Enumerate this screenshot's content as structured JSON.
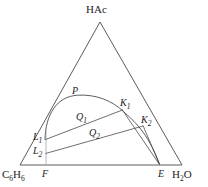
{
  "figure": {
    "type": "ternary-phase-diagram",
    "width": 208,
    "height": 187,
    "background_color": "#ffffff",
    "line_color": "#4a4a4a",
    "text_color": "#1c1c1c"
  },
  "vertices": {
    "apex": {
      "label": "HAc",
      "x": 100,
      "y": 22
    },
    "bottom_left": {
      "label_main": "C",
      "label_sub1": "6",
      "label_mid": "H",
      "label_sub2": "6",
      "label_full": "C6H6",
      "x": 20,
      "y": 165
    },
    "bottom_right": {
      "label_main": "H",
      "label_sub": "2",
      "label_tail": "O",
      "label_full": "H2O",
      "x": 182,
      "y": 165
    }
  },
  "points": [
    {
      "name": "P",
      "label": "P",
      "sub": "",
      "x": 78,
      "y": 95,
      "desc": "plait-point"
    },
    {
      "name": "K1",
      "label": "K",
      "sub": "1",
      "x": 122,
      "y": 109,
      "desc": "tie-line-right-endpoint-1"
    },
    {
      "name": "K2",
      "label": "K",
      "sub": "2",
      "x": 143,
      "y": 126,
      "desc": "tie-line-right-endpoint-2"
    },
    {
      "name": "L1",
      "label": "L",
      "sub": "1",
      "x": 45,
      "y": 139,
      "desc": "tie-line-left-endpoint-1"
    },
    {
      "name": "L2",
      "label": "L",
      "sub": "2",
      "x": 45,
      "y": 153,
      "desc": "tie-line-left-endpoint-2"
    },
    {
      "name": "Q1",
      "label": "Q",
      "sub": "1",
      "x": 82,
      "y": 120,
      "desc": "mixture-point-1"
    },
    {
      "name": "Q2",
      "label": "Q",
      "sub": "2",
      "x": 95,
      "y": 136,
      "desc": "mixture-point-2"
    },
    {
      "name": "F",
      "label": "F",
      "sub": "",
      "x": 46,
      "y": 165,
      "desc": "feed-point-on-base"
    },
    {
      "name": "E",
      "label": "E",
      "sub": "",
      "x": 160,
      "y": 165,
      "desc": "solvent-point-on-base"
    }
  ],
  "labels": {
    "apex": "HAc",
    "P": "P",
    "K1": "K",
    "K1_sub": "1",
    "K2": "K",
    "K2_sub": "2",
    "L1": "L",
    "L1_sub": "1",
    "L2": "L",
    "L2_sub": "2",
    "Q1": "Q",
    "Q1_sub": "1",
    "Q2": "Q",
    "Q2_sub": "2",
    "F": "F",
    "E": "E",
    "benzene_c": "C",
    "benzene_sub1": "6",
    "benzene_h": "H",
    "benzene_sub2": "6",
    "water_h": "H",
    "water_sub": "2",
    "water_o": "O"
  },
  "geometry": {
    "triangle": "M100,22 L20,165 L182,165 Z",
    "binodal_curve": "M45,140 C46,112 58,96 78,95 C98,94 114,101 124,111 C134,121 148,130 160,164",
    "tie_line_1": "M45,140 L122,110",
    "tie_line_2": "M45,154 L143,126",
    "ray_F_K1": "M46,165 L122,110",
    "ray_E_K1": "M160,165 L122,110",
    "ray_E_K2": "M160,165 L143,126",
    "vertical_F": "M46,165 L46,131"
  }
}
